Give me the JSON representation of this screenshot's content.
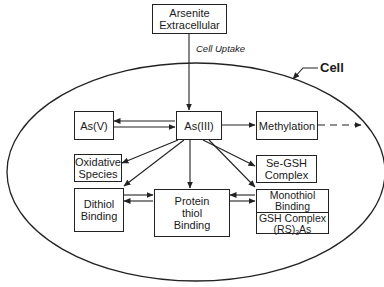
{
  "diagram": {
    "container_label": "Cell",
    "edge_label_uptake": "Cell Uptake",
    "nodes": {
      "arsenite_ext": {
        "line1": "Arsenite",
        "line2": "Extracellular"
      },
      "as3": {
        "label": "As(III)"
      },
      "as5": {
        "label": "As(V)"
      },
      "methylation": {
        "label": "Methylation"
      },
      "oxidative": {
        "line1": "Oxidative",
        "line2": "Species"
      },
      "se_gsh": {
        "line1": "Se-GSH",
        "line2": "Complex"
      },
      "dithiol": {
        "line1": "Dithiol",
        "line2": "Binding"
      },
      "protein_thiol": {
        "line1": "Protein",
        "line2": "thiol",
        "line3": "Binding"
      },
      "monothiol": {
        "line1": "Monothiol",
        "line2": "Binding"
      },
      "gsh_complex": {
        "line1": "GSH Complex",
        "line2_pre": "(RS)",
        "line2_sub": "3",
        "line2_post": "As"
      }
    },
    "edges": [
      {
        "from": "Arsenite Extracellular",
        "to": "As(III)",
        "label": "Cell Uptake"
      },
      {
        "from": "As(III)",
        "to": "As(V)",
        "bidirectional": true
      },
      {
        "from": "As(III)",
        "to": "Methylation"
      },
      {
        "from": "Methylation",
        "to": "outside cell",
        "style": "dashed"
      },
      {
        "from": "As(III)",
        "to": "Oxidative Species"
      },
      {
        "from": "As(III)",
        "to": "Dithiol Binding"
      },
      {
        "from": "As(III)",
        "to": "Protein thiol Binding"
      },
      {
        "from": "As(III)",
        "to": "Se-GSH Complex"
      },
      {
        "from": "As(III)",
        "to": "Monothiol Binding"
      },
      {
        "from": "Dithiol Binding",
        "to": "Protein thiol Binding",
        "bidirectional": true
      },
      {
        "from": "Monothiol Binding",
        "to": "Protein thiol Binding",
        "bidirectional": true
      }
    ],
    "colors": {
      "line": "#222222",
      "background": "#ffffff"
    }
  }
}
